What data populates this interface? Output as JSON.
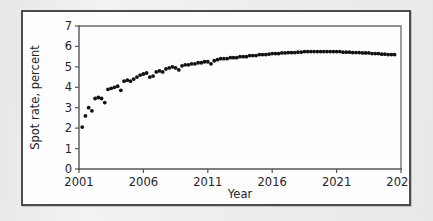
{
  "figure": {
    "panel_background": "#fdfdfd",
    "page_background": "#ececed",
    "border_color": "#4c4c4e"
  },
  "chart_data": {
    "type": "scatter",
    "title": "",
    "subtitle": "",
    "xlabel": "Year",
    "ylabel": "Spot rate, percent",
    "xlim": [
      2001,
      2026
    ],
    "ylim": [
      0,
      7
    ],
    "xticks": [
      2001,
      2006,
      2011,
      2016,
      2021,
      2026
    ],
    "yticks": [
      0,
      1,
      2,
      3,
      4,
      5,
      6,
      7
    ],
    "xtick_labels": [
      "2001",
      "2006",
      "2011",
      "2016",
      "2021",
      "2026"
    ],
    "ytick_labels": [
      "0",
      "1",
      "2",
      "3",
      "4",
      "5",
      "6",
      "7"
    ],
    "grid": false,
    "legend": null,
    "legend_position": "none",
    "marker_color": "#121214",
    "marker_size": 1.9,
    "series": [
      {
        "name": "Spot rate",
        "x": [
          2001.25,
          2001.5,
          2001.75,
          2002.0,
          2002.25,
          2002.5,
          2002.75,
          2003.0,
          2003.25,
          2003.5,
          2003.75,
          2004.0,
          2004.25,
          2004.5,
          2004.75,
          2005.0,
          2005.25,
          2005.5,
          2005.75,
          2006.0,
          2006.25,
          2006.5,
          2006.75,
          2007.0,
          2007.25,
          2007.5,
          2007.75,
          2008.0,
          2008.25,
          2008.5,
          2008.75,
          2009.0,
          2009.25,
          2009.5,
          2009.75,
          2010.0,
          2010.25,
          2010.5,
          2010.75,
          2011.0,
          2011.25,
          2011.5,
          2011.75,
          2012.0,
          2012.25,
          2012.5,
          2012.75,
          2013.0,
          2013.25,
          2013.5,
          2013.75,
          2014.0,
          2014.25,
          2014.5,
          2014.75,
          2015.0,
          2015.25,
          2015.5,
          2015.75,
          2016.0,
          2016.25,
          2016.5,
          2016.75,
          2017.0,
          2017.25,
          2017.5,
          2017.75,
          2018.0,
          2018.25,
          2018.5,
          2018.75,
          2019.0,
          2019.25,
          2019.5,
          2019.75,
          2020.0,
          2020.25,
          2020.5,
          2020.75,
          2021.0,
          2021.25,
          2021.5,
          2021.75,
          2022.0,
          2022.25,
          2022.5,
          2022.75,
          2023.0,
          2023.25,
          2023.5,
          2023.75,
          2024.0,
          2024.25,
          2024.5,
          2024.75,
          2025.0,
          2025.25,
          2025.5
        ],
        "y": [
          2.05,
          2.6,
          3.0,
          2.85,
          3.45,
          3.5,
          3.45,
          3.25,
          3.9,
          3.95,
          4.0,
          4.05,
          3.85,
          4.3,
          4.35,
          4.3,
          4.4,
          4.5,
          4.6,
          4.65,
          4.7,
          4.5,
          4.55,
          4.75,
          4.8,
          4.75,
          4.9,
          4.95,
          5.0,
          4.95,
          4.85,
          5.05,
          5.1,
          5.1,
          5.15,
          5.15,
          5.2,
          5.2,
          5.25,
          5.25,
          5.15,
          5.3,
          5.35,
          5.4,
          5.4,
          5.4,
          5.45,
          5.45,
          5.45,
          5.5,
          5.5,
          5.5,
          5.55,
          5.55,
          5.55,
          5.6,
          5.6,
          5.6,
          5.62,
          5.65,
          5.65,
          5.65,
          5.68,
          5.68,
          5.7,
          5.7,
          5.7,
          5.72,
          5.72,
          5.75,
          5.75,
          5.75,
          5.75,
          5.75,
          5.75,
          5.75,
          5.75,
          5.75,
          5.75,
          5.75,
          5.75,
          5.72,
          5.72,
          5.72,
          5.7,
          5.7,
          5.7,
          5.68,
          5.68,
          5.68,
          5.65,
          5.65,
          5.65,
          5.62,
          5.62,
          5.6,
          5.6,
          5.6
        ]
      }
    ]
  }
}
